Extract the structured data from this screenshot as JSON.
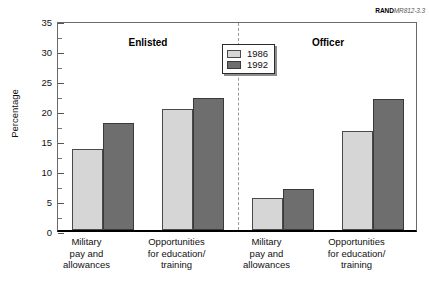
{
  "figure_id": {
    "prefix": "RAND",
    "number": "MR812-3.3"
  },
  "chart_data": {
    "type": "bar",
    "title": "",
    "xlabel": "",
    "ylabel": "Percentage",
    "ylim": [
      0,
      35
    ],
    "y_major_ticks": [
      0,
      5,
      10,
      15,
      20,
      25,
      30,
      35
    ],
    "y_minor_ticks": [
      2.5,
      7.5,
      12.5,
      17.5,
      22.5,
      27.5,
      32.5
    ],
    "y_tick_labels": [
      "0",
      "5",
      "10",
      "15",
      "20",
      "25",
      "30",
      "35"
    ],
    "grid": false,
    "legend_position": "top-center",
    "panels": [
      {
        "name": "Enlisted",
        "categories": [
          "Military\npay and\nallowances",
          "Opportunities\nfor education/\ntraining"
        ]
      },
      {
        "name": "Officer",
        "categories": [
          "Military\npay and\nallowances",
          "Opportunities\nfor education/\ntraining"
        ]
      }
    ],
    "categories": [
      "Military pay and allowances",
      "Opportunities for education/ training",
      "Military pay and allowances",
      "Opportunities for education/ training"
    ],
    "series": [
      {
        "name": "1986",
        "color": "#d6d6d6",
        "values": [
          13.5,
          20.1,
          5.3,
          16.5
        ]
      },
      {
        "name": "1992",
        "color": "#6e6e6e",
        "values": [
          17.9,
          22.0,
          6.8,
          21.8
        ]
      }
    ],
    "divider": true
  },
  "legend": {
    "entries": [
      {
        "label": "1986"
      },
      {
        "label": "1992"
      }
    ]
  },
  "panel_titles": {
    "left": "Enlisted",
    "right": "Officer"
  },
  "category_labels": [
    {
      "line1": "Military",
      "line2": "pay and",
      "line3": "allowances"
    },
    {
      "line1": "Opportunities",
      "line2": "for education/",
      "line3": "training"
    },
    {
      "line1": "Military",
      "line2": "pay and",
      "line3": "allowances"
    },
    {
      "line1": "Opportunities",
      "line2": "for education/",
      "line3": "training"
    }
  ]
}
